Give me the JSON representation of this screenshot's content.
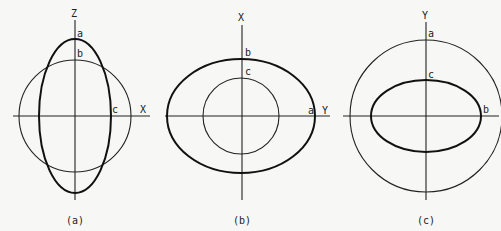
{
  "panels": [
    {
      "caption": "(a)",
      "vertical_axis": "Z",
      "horizontal_axis": "X",
      "points": {
        "a": "a",
        "b": "b",
        "c": "c"
      }
    },
    {
      "caption": "(b)",
      "vertical_axis": "X",
      "horizontal_axis": "Y",
      "points": {
        "a": "a",
        "b": "b",
        "c": "c"
      }
    },
    {
      "caption": "(c)",
      "vertical_axis": "Y",
      "horizontal_axis": "b",
      "points": {
        "a": "a",
        "b": "b",
        "c": "c"
      }
    }
  ]
}
